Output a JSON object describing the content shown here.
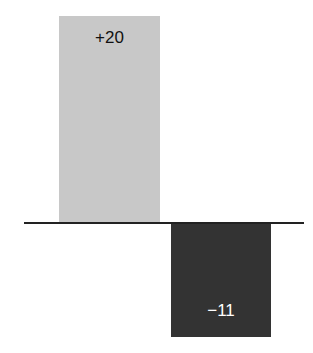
{
  "chart_data": {
    "type": "bar",
    "title": "",
    "xlabel": "",
    "ylabel": "",
    "categories": [
      "A",
      "B"
    ],
    "values": [
      20,
      -11
    ],
    "labels": [
      "+20",
      "−11"
    ],
    "colors": [
      "#c8c8c8",
      "#333333"
    ],
    "label_colors": [
      "#111111",
      "#ffffff"
    ],
    "ylim": [
      -11,
      20
    ],
    "grid": false,
    "legend": "none"
  },
  "layout": {
    "zero_y": 223,
    "px_per_unit": 10.35,
    "bars": [
      {
        "left": 59,
        "width": 101,
        "label_offset": 12
      },
      {
        "left": 171,
        "width": 100,
        "label_offset": -36
      }
    ]
  }
}
